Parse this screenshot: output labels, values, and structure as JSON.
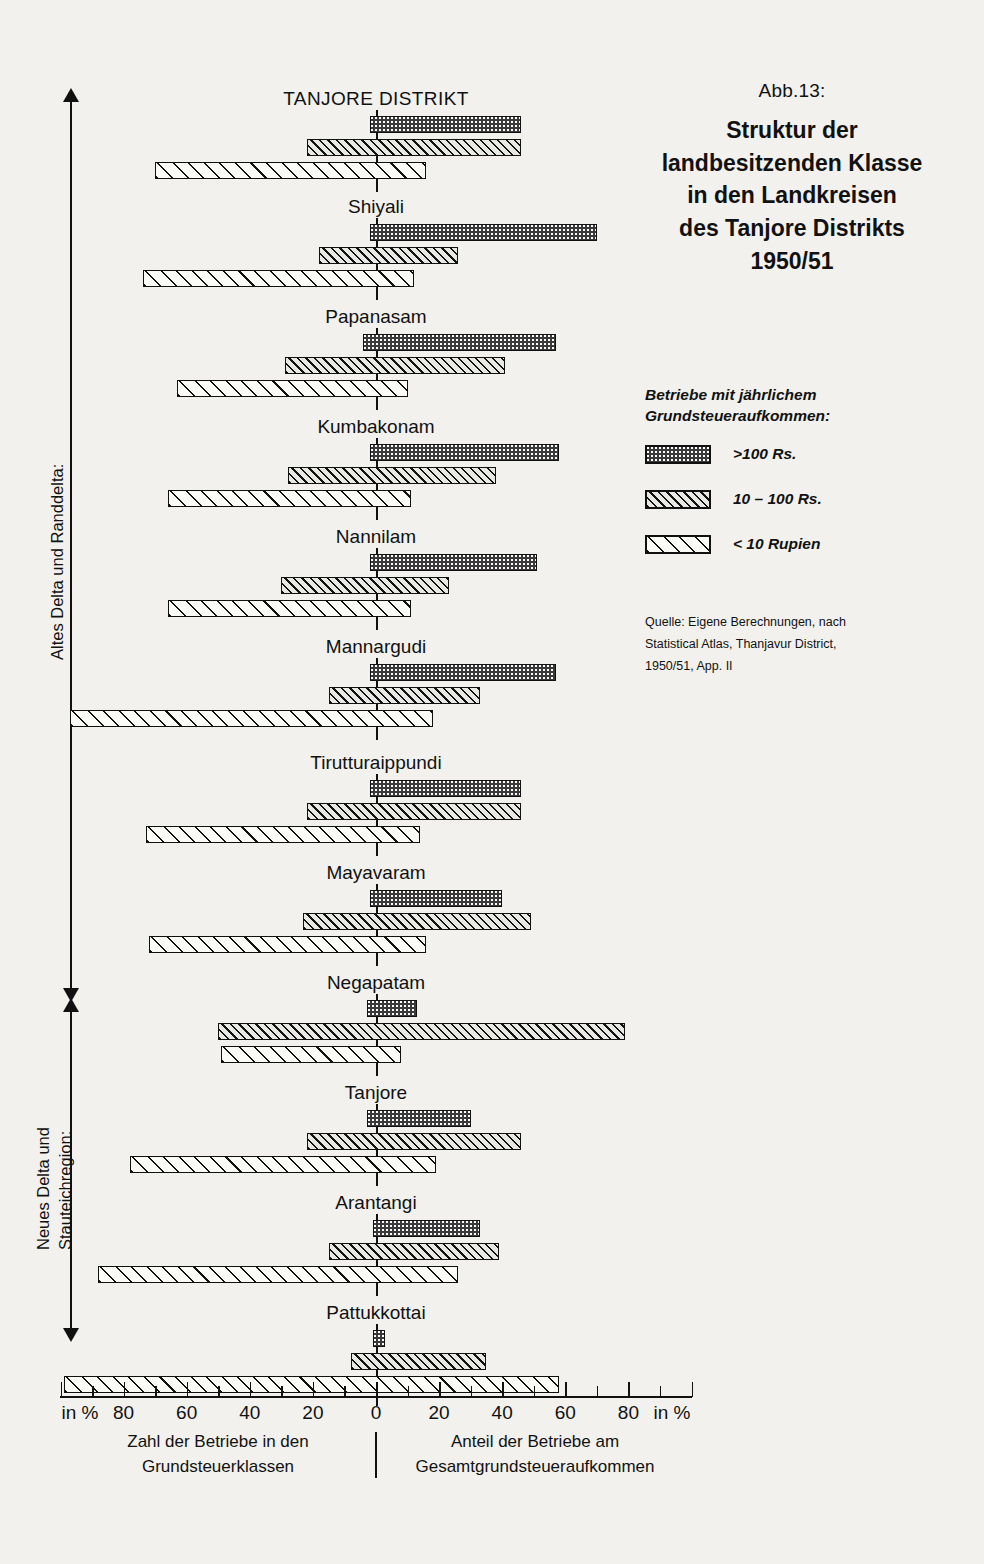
{
  "figure": {
    "number": "Abb.13:",
    "title_lines": [
      "Struktur der",
      "landbesitzenden Klasse",
      "in den Landkreisen",
      "des Tanjore Distrikts",
      "1950/51"
    ]
  },
  "legend": {
    "heading_lines": [
      "Betriebe mit jährlichem",
      "Grundsteueraufkommen:"
    ],
    "items": [
      {
        "label": ">100 Rs.",
        "pattern": "dotted",
        "key": "gt100"
      },
      {
        "label": "10 – 100 Rs.",
        "pattern": "dense-hatch",
        "key": "r10_100"
      },
      {
        "label": "< 10 Rupien",
        "pattern": "sparse-hatch",
        "key": "lt10"
      }
    ]
  },
  "source": {
    "lines": [
      "Quelle: Eigene Berechnungen, nach",
      "Statistical Atlas, Thanjavur District,",
      "1950/51, App. II"
    ]
  },
  "regions": [
    {
      "label": "Altes Delta und Randdelta:"
    },
    {
      "label": "Neues Delta und",
      "label2": "Stauteichregion:"
    }
  ],
  "axis": {
    "left_unit": "in %",
    "right_unit": "in %",
    "tick_labels": [
      "80",
      "60",
      "40",
      "20",
      "0",
      "20",
      "40",
      "60",
      "80"
    ],
    "left_caption_lines": [
      "Zahl der Betriebe in den",
      "Grundsteuerklassen"
    ],
    "right_caption_lines": [
      "Anteil der Betriebe am",
      "Gesamtgrundsteueraufkommen"
    ]
  },
  "chart_data": {
    "type": "bar",
    "orientation": "horizontal-diverging",
    "title": "Struktur der landbesitzenden Klasse in den Landkreisen des Tanjore Distrikts 1950/51",
    "xlabel_left": "Zahl der Betriebe in den Grundsteuerklassen",
    "xlabel_right": "Anteil der Betriebe am Gesamtgrundsteueraufkommen",
    "xlim": [
      -100,
      100
    ],
    "xunit": "%",
    "xticks": [
      -80,
      -60,
      -40,
      -20,
      0,
      20,
      40,
      60,
      80
    ],
    "grid": false,
    "legend_position": "right",
    "series": [
      {
        "name": ">100 Rs.",
        "pattern": "dotted"
      },
      {
        "name": "10 – 100 Rs.",
        "pattern": "dense-hatch"
      },
      {
        "name": "< 10 Rupien",
        "pattern": "sparse-hatch"
      }
    ],
    "note": "Each bar spans from its share of holdings (left, negative %) to its share of total land-tax revenue (right, positive %).",
    "categories": [
      "TANJORE DISTRIKT",
      "Shiyali",
      "Papanasam",
      "Kumbakonam",
      "Nannilam",
      "Mannargudi",
      "Tirutturaippundi",
      "Mayavaram",
      "Negapatam",
      "Tanjore",
      "Arantangi",
      "Pattukkottai"
    ],
    "groups": [
      {
        "name": "TANJORE DISTRIKT",
        "region": 0,
        "bars": [
          {
            "series": ">100 Rs.",
            "count_pct": 2,
            "revenue_pct": 46
          },
          {
            "series": "10 – 100 Rs.",
            "count_pct": 22,
            "revenue_pct": 46
          },
          {
            "series": "< 10 Rupien",
            "count_pct": 70,
            "revenue_pct": 16
          }
        ]
      },
      {
        "name": "Shiyali",
        "region": 0,
        "bars": [
          {
            "series": ">100 Rs.",
            "count_pct": 2,
            "revenue_pct": 70
          },
          {
            "series": "10 – 100 Rs.",
            "count_pct": 18,
            "revenue_pct": 26
          },
          {
            "series": "< 10 Rupien",
            "count_pct": 74,
            "revenue_pct": 12
          }
        ]
      },
      {
        "name": "Papanasam",
        "region": 0,
        "bars": [
          {
            "series": ">100 Rs.",
            "count_pct": 4,
            "revenue_pct": 57
          },
          {
            "series": "10 – 100 Rs.",
            "count_pct": 29,
            "revenue_pct": 41
          },
          {
            "series": "< 10 Rupien",
            "count_pct": 63,
            "revenue_pct": 10
          }
        ]
      },
      {
        "name": "Kumbakonam",
        "region": 0,
        "bars": [
          {
            "series": ">100 Rs.",
            "count_pct": 2,
            "revenue_pct": 58
          },
          {
            "series": "10 – 100 Rs.",
            "count_pct": 28,
            "revenue_pct": 38
          },
          {
            "series": "< 10 Rupien",
            "count_pct": 66,
            "revenue_pct": 11
          }
        ]
      },
      {
        "name": "Nannilam",
        "region": 0,
        "bars": [
          {
            "series": ">100 Rs.",
            "count_pct": 2,
            "revenue_pct": 51
          },
          {
            "series": "10 – 100 Rs.",
            "count_pct": 30,
            "revenue_pct": 23
          },
          {
            "series": "< 10 Rupien",
            "count_pct": 66,
            "revenue_pct": 11
          }
        ]
      },
      {
        "name": "Mannargudi",
        "region": 0,
        "bars": [
          {
            "series": ">100 Rs.",
            "count_pct": 2,
            "revenue_pct": 57
          },
          {
            "series": "10 – 100 Rs.",
            "count_pct": 15,
            "revenue_pct": 33
          },
          {
            "series": "< 10 Rupien",
            "count_pct": 97,
            "revenue_pct": 18
          }
        ]
      },
      {
        "name": "Tirutturaippundi",
        "region": 0,
        "bars": [
          {
            "series": ">100 Rs.",
            "count_pct": 2,
            "revenue_pct": 46
          },
          {
            "series": "10 – 100 Rs.",
            "count_pct": 22,
            "revenue_pct": 46
          },
          {
            "series": "< 10 Rupien",
            "count_pct": 73,
            "revenue_pct": 14
          }
        ]
      },
      {
        "name": "Mayavaram",
        "region": 0,
        "bars": [
          {
            "series": ">100 Rs.",
            "count_pct": 2,
            "revenue_pct": 40
          },
          {
            "series": "10 – 100 Rs.",
            "count_pct": 23,
            "revenue_pct": 49
          },
          {
            "series": "< 10 Rupien",
            "count_pct": 72,
            "revenue_pct": 16
          }
        ]
      },
      {
        "name": "Negapatam",
        "region": 0,
        "bars": [
          {
            "series": ">100 Rs.",
            "count_pct": 3,
            "revenue_pct": 13
          },
          {
            "series": "10 – 100 Rs.",
            "count_pct": 50,
            "revenue_pct": 79
          },
          {
            "series": "< 10 Rupien",
            "count_pct": 49,
            "revenue_pct": 8
          }
        ]
      },
      {
        "name": "Tanjore",
        "region": 1,
        "bars": [
          {
            "series": ">100 Rs.",
            "count_pct": 3,
            "revenue_pct": 30
          },
          {
            "series": "10 – 100 Rs.",
            "count_pct": 22,
            "revenue_pct": 46
          },
          {
            "series": "< 10 Rupien",
            "count_pct": 78,
            "revenue_pct": 19
          }
        ]
      },
      {
        "name": "Arantangi",
        "region": 1,
        "bars": [
          {
            "series": ">100 Rs.",
            "count_pct": 1,
            "revenue_pct": 33
          },
          {
            "series": "10 – 100 Rs.",
            "count_pct": 15,
            "revenue_pct": 39
          },
          {
            "series": "< 10 Rupien",
            "count_pct": 88,
            "revenue_pct": 26
          }
        ]
      },
      {
        "name": "Pattukkottai",
        "region": 1,
        "bars": [
          {
            "series": ">100 Rs.",
            "count_pct": 1,
            "revenue_pct": 3
          },
          {
            "series": "10 – 100 Rs.",
            "count_pct": 8,
            "revenue_pct": 35
          },
          {
            "series": "< 10 Rupien",
            "count_pct": 99,
            "revenue_pct": 58
          }
        ]
      }
    ]
  }
}
